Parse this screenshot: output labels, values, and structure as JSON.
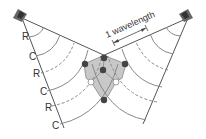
{
  "diagram": {
    "annotation": "1 wavelength",
    "left_line_labels": [
      "R",
      "C",
      "R",
      "C",
      "R",
      "C"
    ],
    "legend_meaning": {
      "R": "rarefaction",
      "C": "compression"
    },
    "colors": {
      "line": "#555555",
      "wave_arc": "#888888",
      "overlap_fill": "#c8c8c8",
      "dark_node": "#444444",
      "light_node": "#ffffff",
      "speaker": "#666666"
    }
  }
}
